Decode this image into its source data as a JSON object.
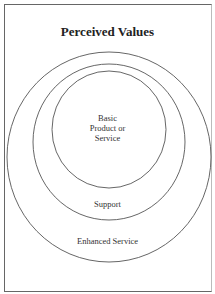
{
  "title": "Perceived Values",
  "diagram": {
    "type": "nested-circles",
    "layers": [
      {
        "name": "core",
        "label_lines": [
          "Basic",
          "Product or",
          "Service"
        ]
      },
      {
        "name": "middle",
        "label": "Support"
      },
      {
        "name": "outer",
        "label": "Enhanced Service"
      }
    ]
  },
  "colors": {
    "stroke": "#555555",
    "text": "#333333",
    "background": "#ffffff"
  }
}
